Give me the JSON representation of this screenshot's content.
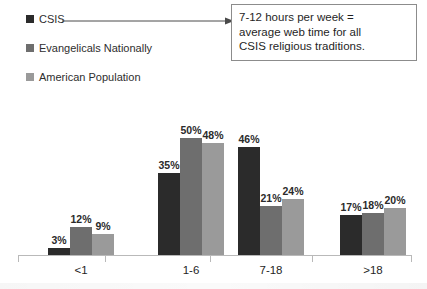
{
  "legend": {
    "items": [
      {
        "label": "CSIS",
        "color": "#2b2b2b",
        "icon": "square-swatch-icon"
      },
      {
        "label": "Evangelicals Nationally",
        "color": "#6e6e6e",
        "icon": "square-swatch-icon"
      },
      {
        "label": "American Population",
        "color": "#9a9a9a",
        "icon": "square-swatch-icon"
      }
    ]
  },
  "annotation": {
    "icon": "right-arrow-icon",
    "lines": [
      "7-12 hours per week =",
      "average web time for all",
      "CSIS religious traditions."
    ]
  },
  "chart_data": {
    "type": "bar",
    "title": "",
    "subtitle": "",
    "xlabel": "",
    "ylabel": "",
    "ylim": [
      0,
      55
    ],
    "grid": false,
    "legend_position": "top-left",
    "categories": [
      "<1",
      "1-6",
      "7-18",
      ">18"
    ],
    "value_suffix": "%",
    "series": [
      {
        "name": "CSIS",
        "color": "#2b2b2b",
        "values": [
          3,
          35,
          46,
          17
        ],
        "labels": [
          "3%",
          "35%",
          "46%",
          "17%"
        ]
      },
      {
        "name": "Evangelicals Nationally",
        "color": "#6e6e6e",
        "values": [
          12,
          50,
          21,
          18
        ],
        "labels": [
          "12%",
          "50%",
          "21%",
          "18%"
        ]
      },
      {
        "name": "American Population",
        "color": "#9a9a9a",
        "values": [
          9,
          48,
          24,
          20
        ],
        "labels": [
          "9%",
          "48%",
          "24%",
          "20%"
        ]
      }
    ],
    "annotations": [
      "7-12 hours per week = average web time for all CSIS religious traditions."
    ]
  }
}
